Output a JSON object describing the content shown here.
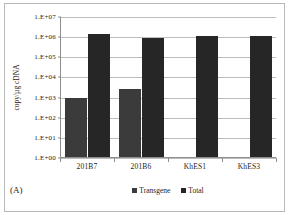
{
  "panel": {
    "label": "(A)"
  },
  "chart_data": {
    "type": "bar",
    "title": "",
    "xlabel": "",
    "ylabel": "copy/µg cDNA",
    "categories": [
      "201B7",
      "201B6",
      "KhES1",
      "KhES3"
    ],
    "series": [
      {
        "name": "Transgene",
        "color": "#3b3b3b",
        "values": [
          900,
          2500,
          null,
          null
        ]
      },
      {
        "name": "Total",
        "color": "#262626",
        "values": [
          1300000,
          800000,
          980000,
          1050000
        ]
      }
    ],
    "yscale": "log",
    "ylim": [
      1,
      10000000
    ],
    "ytick_values": [
      10000000,
      1000000,
      100000,
      10000,
      1000,
      100,
      10,
      1
    ],
    "ytick_labels": [
      "1.E+07",
      "1.E+06",
      "1.E+05",
      "1.E+04",
      "1.E+03",
      "1.E+02",
      "1.E+01",
      "1.E+00"
    ],
    "grid": true,
    "legend_position": "bottom"
  }
}
